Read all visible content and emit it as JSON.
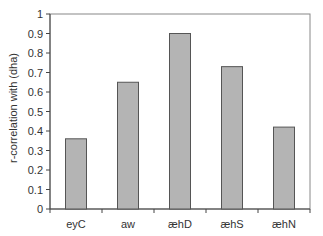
{
  "chart_data": {
    "type": "bar",
    "title": "",
    "xlabel": "",
    "ylabel": "r-correlation with (dha)",
    "categories": [
      "eyC",
      "aw",
      "æhD",
      "æhS",
      "æhN"
    ],
    "values": [
      0.36,
      0.65,
      0.9,
      0.73,
      0.42
    ],
    "ylim": [
      0,
      1
    ],
    "yticks": [
      "0",
      "0.1",
      "0.2",
      "0.3",
      "0.4",
      "0.5",
      "0.6",
      "0.7",
      "0.8",
      "0.9",
      "1"
    ],
    "grid": false,
    "legend": null,
    "bar_color": "#b4b4b4",
    "bar_edge_color": "#555555"
  }
}
